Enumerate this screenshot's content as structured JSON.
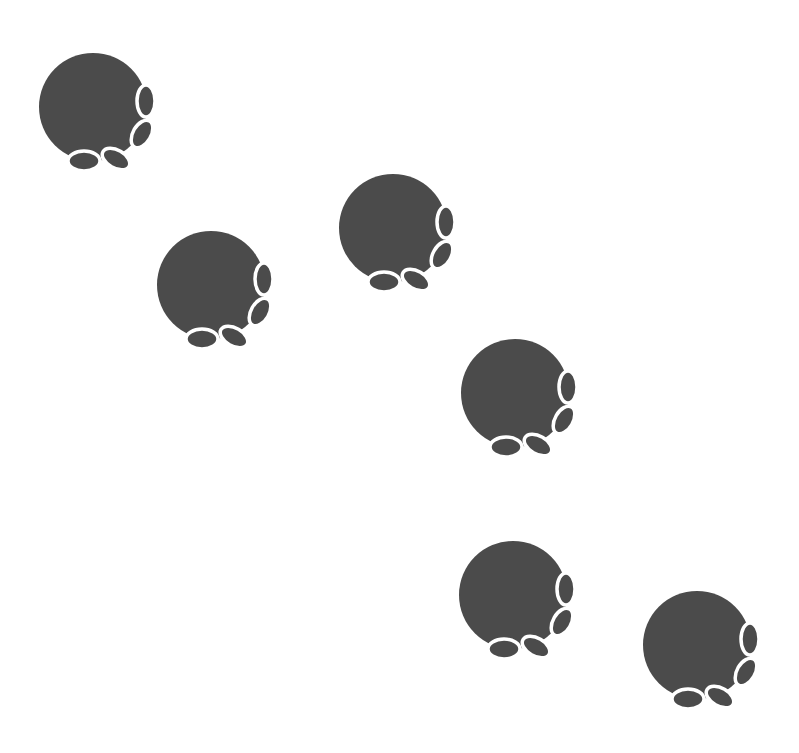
{
  "scene": {
    "description": "Trail of six paw prints on white background",
    "background": "#ffffff",
    "paw_color": "#4b4b4b",
    "outline_color": "#ffffff",
    "pad_radius": 54,
    "toes": [
      {
        "dx": 53,
        "dy": -6,
        "rx": 9,
        "ry": 16,
        "rot": 0
      },
      {
        "dx": 49,
        "dy": 27,
        "rx": 9,
        "ry": 15,
        "rot": 30
      },
      {
        "dx": 23,
        "dy": 52,
        "rx": 9,
        "ry": 15,
        "rot": -60
      },
      {
        "dx": -9,
        "dy": 54,
        "rx": 16,
        "ry": 10,
        "rot": 0
      }
    ],
    "paw_prints": [
      {
        "id": "paw-print-1",
        "cx": 93,
        "cy": 107
      },
      {
        "id": "paw-print-2",
        "cx": 211,
        "cy": 285
      },
      {
        "id": "paw-print-3",
        "cx": 393,
        "cy": 228
      },
      {
        "id": "paw-print-4",
        "cx": 515,
        "cy": 393
      },
      {
        "id": "paw-print-5",
        "cx": 513,
        "cy": 595
      },
      {
        "id": "paw-print-6",
        "cx": 697,
        "cy": 645
      }
    ]
  }
}
